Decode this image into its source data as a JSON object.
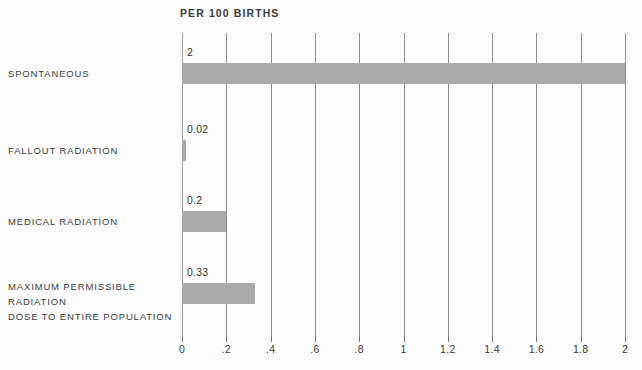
{
  "chart_data": {
    "type": "bar",
    "orientation": "horizontal",
    "title": "PER 100 BIRTHS",
    "xlabel": "",
    "ylabel": "",
    "xlim": [
      0,
      2
    ],
    "grid": true,
    "legend": "none",
    "categories": [
      "SPONTANEOUS",
      "FALLOUT RADIATION",
      "MEDICAL RADIATION",
      "MAXIMUM PERMISSIBLE RADIATION\nDOSE TO ENTIRE POPULATION"
    ],
    "values": [
      2,
      0.02,
      0.2,
      0.33
    ],
    "value_labels": [
      "2",
      "0.02",
      "0.2",
      "0.33"
    ],
    "xticks": [
      0,
      0.2,
      0.4,
      0.6,
      0.8,
      1,
      1.2,
      1.4,
      1.6,
      1.8,
      2
    ],
    "xticklabels": [
      "0",
      ".2",
      ".4",
      ".6",
      ".8",
      "1",
      "1.2",
      "1.4",
      "1.6",
      "1.8",
      "2"
    ],
    "bar_color": "#a9a9a9",
    "gridline_color": "#8d8d8d",
    "text_color": "#3c3c3c",
    "background_color": "#fdfdfd"
  },
  "footer": {
    "note": ""
  }
}
